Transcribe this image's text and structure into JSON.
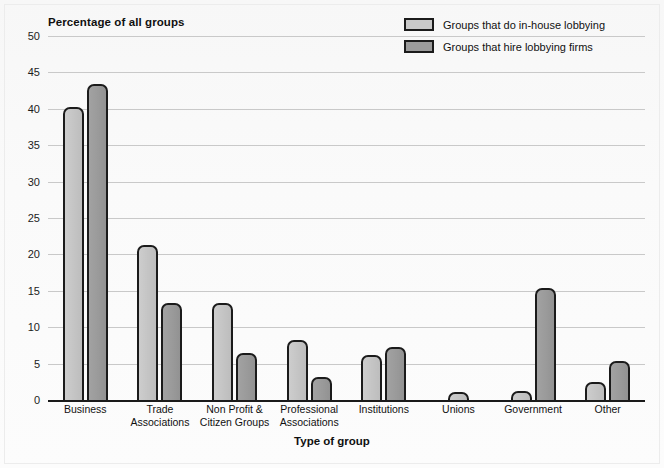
{
  "chart_data": {
    "type": "bar",
    "title": "",
    "ylabel": "Percentage of all groups",
    "xlabel": "Type of group",
    "ylim": [
      0,
      50
    ],
    "yticks": [
      0,
      5,
      10,
      15,
      20,
      25,
      30,
      35,
      40,
      45,
      50
    ],
    "grid": true,
    "legend_position": "top-right",
    "categories": [
      "Business",
      "Trade Associations",
      "Non Profit & Citizen Groups",
      "Professional Associations",
      "Institutions",
      "Unions",
      "Government",
      "Other"
    ],
    "category_lines": [
      [
        "Business"
      ],
      [
        "Trade",
        "Associations"
      ],
      [
        "Non Profit &",
        "Citizen Groups"
      ],
      [
        "Professional",
        "Associations"
      ],
      [
        "Institutions"
      ],
      [
        "Unions"
      ],
      [
        "Government"
      ],
      [
        "Other"
      ]
    ],
    "series": [
      {
        "name": "Groups that do in-house lobbying",
        "color": "#c9c9c9",
        "values": [
          40.5,
          21.6,
          13.6,
          8.5,
          6.5,
          1.4,
          1.5,
          2.7
        ]
      },
      {
        "name": "Groups that hire lobbying firms",
        "color": "#9b9b9b",
        "values": [
          43.7,
          13.6,
          6.7,
          3.5,
          7.6,
          0,
          15.6,
          5.6
        ]
      }
    ]
  },
  "colors": {
    "background": "#fbfbfb",
    "bar_outline": "#1b1b1b",
    "gridline": "#c9c9c9",
    "axis": "#1a1a1a"
  }
}
